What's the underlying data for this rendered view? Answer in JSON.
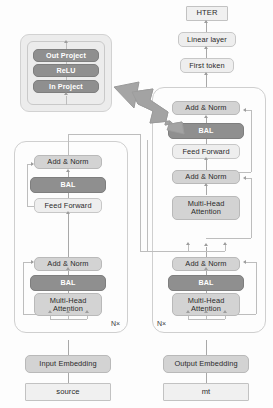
{
  "diagram": {
    "colors": {
      "light_block": "#d3d3d3",
      "pale_block": "#eeeeee",
      "dark_block": "#8f8f8f",
      "io_block": "#f0f0f0",
      "container_border": "#cfcfcf",
      "connector": "#a8a8a8",
      "big_arrow": "#9e9e9e",
      "inset_bg": "#ececec"
    },
    "inset": {
      "name": "BAL internals",
      "blocks": [
        {
          "label": "Out Project",
          "style": "dark"
        },
        {
          "label": "ReLU",
          "style": "dark"
        },
        {
          "label": "In Project",
          "style": "dark"
        }
      ]
    },
    "output_head": [
      {
        "label": "HTER",
        "style": "square"
      },
      {
        "label": "Linear layer",
        "style": "pale"
      },
      {
        "label": "First token",
        "style": "pale"
      }
    ],
    "encoder": {
      "name": "encoder",
      "repeat_label": "N×",
      "blocks": [
        {
          "label": "Add & Norm",
          "style": "light"
        },
        {
          "label": "BAL",
          "style": "dark"
        },
        {
          "label": "Feed Forward",
          "style": "pale"
        },
        {
          "label": "Add & Norm",
          "style": "light"
        },
        {
          "label": "BAL",
          "style": "dark"
        },
        {
          "label": "Multi-Head\nAttention",
          "style": "light"
        }
      ],
      "embedding": {
        "label": "Input Embedding",
        "style": "light"
      },
      "input": {
        "label": "source",
        "style": "square"
      }
    },
    "decoder": {
      "name": "decoder",
      "repeat_label": "N×",
      "blocks": [
        {
          "label": "Add & Norm",
          "style": "light"
        },
        {
          "label": "BAL",
          "style": "dark"
        },
        {
          "label": "Feed Forward",
          "style": "pale"
        },
        {
          "label": "Add & Norm",
          "style": "light"
        },
        {
          "label": "Multi-Head\nAttention",
          "style": "light"
        },
        {
          "label": "Add & Norm",
          "style": "light"
        },
        {
          "label": "BAL",
          "style": "dark"
        },
        {
          "label": "Multi-Head\nAttention",
          "style": "light"
        }
      ],
      "embedding": {
        "label": "Output Embedding",
        "style": "light"
      },
      "input": {
        "label": "mt",
        "style": "square"
      }
    }
  }
}
